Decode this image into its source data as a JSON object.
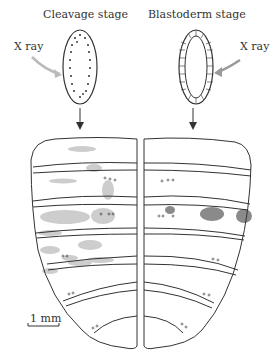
{
  "labels": {
    "left_stage": "Cleavage stage",
    "right_stage": "Blastoderm stage",
    "left_xray": "X ray",
    "right_xray": "X ray",
    "scale_bar": "1 mm"
  },
  "colors": {
    "outline": "#333333",
    "arrow_xray": "#b8b8b8",
    "light_patch": "#cccccc",
    "dark_patch": "#888888"
  }
}
